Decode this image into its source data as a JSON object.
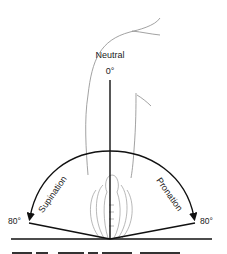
{
  "figure": {
    "type": "range-of-motion-diagram",
    "labels": {
      "neutral": "Neutral",
      "neutral_angle": "0°",
      "left_motion": "Supination",
      "right_motion": "Pronation",
      "left_angle": "80°",
      "right_angle": "80°"
    },
    "caption_fragment": "Figure 5.5 Range of forearm rotation",
    "colors": {
      "line": "#111111",
      "outline": "#8a8a8a",
      "background": "#ffffff"
    }
  }
}
